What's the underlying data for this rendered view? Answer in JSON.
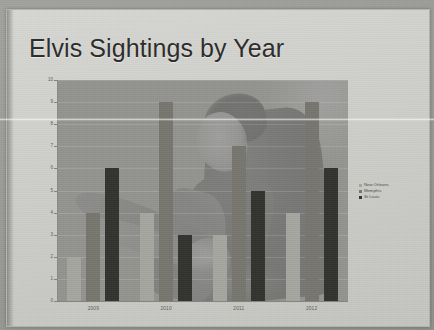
{
  "slide": {
    "title": "Elvis Sightings by Year"
  },
  "chart_data": {
    "type": "bar",
    "title": "Elvis Sightings by Year",
    "xlabel": "",
    "ylabel": "",
    "categories": [
      "2009",
      "2010",
      "2011",
      "2012"
    ],
    "series": [
      {
        "name": "New Orleans",
        "color": "#a6a6a1",
        "values": [
          2,
          4,
          3,
          4
        ]
      },
      {
        "name": "Memphis",
        "color": "#77776f",
        "values": [
          4,
          9,
          7,
          9
        ]
      },
      {
        "name": "St Louis",
        "color": "#33332f",
        "values": [
          6,
          3,
          5,
          6
        ]
      }
    ],
    "ylim": [
      0,
      10
    ],
    "yticks": [
      0,
      1,
      2,
      3,
      4,
      5,
      6,
      7,
      8,
      9,
      10
    ],
    "ytick_labels": [
      "0",
      "1",
      "2",
      "3",
      "4",
      "5",
      "6",
      "7",
      "8",
      "9",
      "10"
    ],
    "grid": true,
    "legend_position": "right",
    "background_image": "elvis-photograph-watermark"
  }
}
